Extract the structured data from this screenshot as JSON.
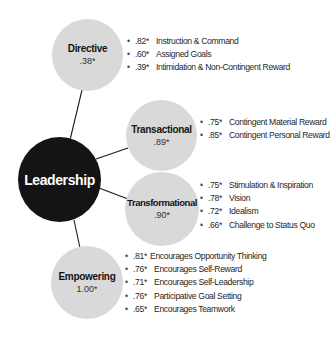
{
  "colors": {
    "sub_node_fill": "#d9d9d9",
    "core_node_fill": "#141414",
    "core_text": "#ffffff",
    "connector": "#1a1a1a"
  },
  "center": {
    "title": "Leadership"
  },
  "nodes": [
    {
      "id": "directive",
      "title": "Directive",
      "value": ".38*",
      "items": [
        {
          "score": ".82*",
          "label": "Instruction & Command"
        },
        {
          "score": ".60*",
          "label": "Assigned Goals"
        },
        {
          "score": ".39*",
          "label": "Intimidation & Non-Contingent Reward"
        }
      ]
    },
    {
      "id": "transactional",
      "title": "Transactional",
      "value": ".89*",
      "items": [
        {
          "score": ".75*",
          "label": "Contingent Material Reward"
        },
        {
          "score": ".85*",
          "label": "Contingent Personal Reward"
        }
      ]
    },
    {
      "id": "transformational",
      "title": "Transformational",
      "value": ".90*",
      "items": [
        {
          "score": ".75*",
          "label": "Stimulation & Inspiration"
        },
        {
          "score": ".78*",
          "label": "Vision"
        },
        {
          "score": ".72*",
          "label": "Idealism"
        },
        {
          "score": ".66*",
          "label": "Challenge to Status Quo"
        }
      ]
    },
    {
      "id": "empowering",
      "title": "Empowering",
      "value": "1.00*",
      "items": [
        {
          "score": ".81*",
          "label": "Encourages Opportunity Thinking"
        },
        {
          "score": ".76*",
          "label": "Encourages Self-Reward"
        },
        {
          "score": ".71*",
          "label": "Encourages Self-Leadership"
        },
        {
          "score": ".76*",
          "label": "Participative Goal Setting"
        },
        {
          "score": ".65*",
          "label": "Encourages Teamwork"
        }
      ]
    }
  ],
  "bullet_glyph": "•"
}
